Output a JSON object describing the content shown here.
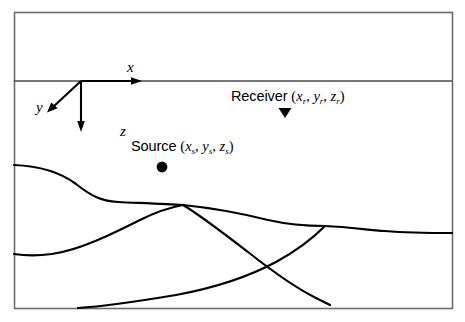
{
  "figure": {
    "name": "seismic-source-receiver-geometry",
    "background_color": "#ffffff",
    "line_color": "#000000",
    "border_color": "#6b6b6b"
  },
  "axes": {
    "origin": {
      "x": 81,
      "y": 81
    },
    "labels": {
      "x": "x",
      "y": "y",
      "z": "z"
    }
  },
  "receiver": {
    "name_label": "Receiver ",
    "open_paren": "(",
    "coord_x": "x",
    "sub_x": "r",
    "sep1": ", ",
    "coord_y": "y",
    "sub_y": "r",
    "sep2": ", ",
    "coord_z": "z",
    "sub_z": "r",
    "close_paren": ")",
    "marker": "triangle-down",
    "marker_position": {
      "x": 285,
      "y": 118
    }
  },
  "source": {
    "name_label": "Source ",
    "open_paren": "(",
    "coord_x": "x",
    "sub_x": "s",
    "sep1": ", ",
    "coord_y": "y",
    "sub_y": "s",
    "sep2": ", ",
    "coord_z": "z",
    "sub_z": "s",
    "close_paren": ")",
    "marker": "filled-circle",
    "marker_position": {
      "x": 162,
      "y": 167
    }
  },
  "geometry": {
    "outer_border": {
      "x": 14,
      "y": 12,
      "width": 438,
      "height": 296
    },
    "surface_line_y": 81,
    "interfaces": [
      {
        "id": "interface-upper",
        "path": "M 14 165 C 40 166 60 172 76 184 C 90 195 100 201 118 202 C 140 203 166 204 183 205"
      },
      {
        "id": "interface-upper-right",
        "path": "M 183 205 C 213 208 244 214 268 220 C 290 225 306 226 325 226 C 350 227 368 230 385 231 C 410 233 432 233 452 233"
      },
      {
        "id": "interface-middle",
        "path": "M 14 254 C 26 256 38 256 52 254 C 80 250 112 234 140 220 C 158 211 172 207 183 205"
      },
      {
        "id": "fault-lower-left",
        "path": "M 183 205 C 200 215 222 232 248 252 C 272 271 296 288 316 298 C 322 301 326 303 330 305"
      },
      {
        "id": "interface-lower",
        "path": "M 78 308 C 110 306 140 301 176 295 C 214 288 248 277 276 262 C 300 249 314 237 325 226"
      }
    ]
  }
}
